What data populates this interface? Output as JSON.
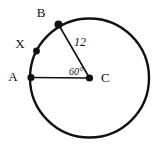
{
  "figure": {
    "background_color": "#ffffff",
    "stroke_color": "#111111",
    "circle": {
      "center_x": 89.5,
      "center_y": 78,
      "radius": 59.5,
      "stroke_width": 2.4
    },
    "points": [
      {
        "id": "A",
        "label": "A",
        "x": 31,
        "y": 77.5,
        "label_x": 13,
        "label_y": 81,
        "dot_radius": 3.6
      },
      {
        "id": "X",
        "label": "X",
        "x": 36.5,
        "y": 51,
        "label_x": 20,
        "label_y": 48,
        "dot_radius": 3.4
      },
      {
        "id": "B",
        "label": "B",
        "x": 58.5,
        "y": 24.5,
        "label_x": 41,
        "label_y": 17,
        "dot_radius": 4.0
      },
      {
        "id": "C",
        "label": "C",
        "x": 89.5,
        "y": 78,
        "label_x": 101,
        "label_y": 82,
        "dot_radius": 3.6
      }
    ],
    "segments": [
      {
        "id": "CA",
        "x1": 89.5,
        "y1": 78,
        "x2": 31,
        "y2": 77.5,
        "stroke_width": 1.6
      },
      {
        "id": "CB",
        "x1": 89.5,
        "y1": 78,
        "x2": 58.5,
        "y2": 24.5,
        "stroke_width": 1.6
      }
    ],
    "measurements": {
      "radius_label": "12",
      "radius_label_x": 80,
      "radius_label_y": 46,
      "angle_label": "60°",
      "angle_label_x": 69,
      "angle_label_y": 75
    }
  }
}
